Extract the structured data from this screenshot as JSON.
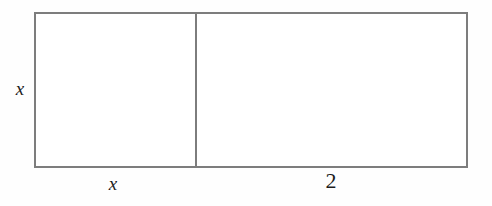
{
  "diagram": {
    "type": "rectangle-area-model",
    "colors": {
      "stroke": "#7d7d7d",
      "fill": "#ffffff",
      "background": "#fefefe",
      "label_text": "#1c1c1c"
    },
    "shapes": {
      "outer_rectangle": {
        "name": "outer-rectangle",
        "x": 34,
        "y": 12,
        "width": 434,
        "height": 156,
        "stroke_width": 2
      },
      "divider_line": {
        "name": "vertical-divider",
        "x": 195,
        "y_top": 12,
        "y_bottom": 168,
        "stroke_width": 2
      },
      "left_region": {
        "name": "left-square",
        "x": 34,
        "y": 12,
        "width": 162,
        "height": 156
      },
      "right_region": {
        "name": "right-rectangle",
        "x": 196,
        "y": 12,
        "width": 272,
        "height": 156
      }
    },
    "labels": {
      "height": "x",
      "width_left": "x",
      "width_right": "2"
    }
  }
}
